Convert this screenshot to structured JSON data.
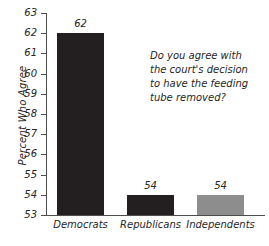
{
  "chart_data": {
    "type": "bar",
    "title": "",
    "xlabel": "",
    "ylabel": "Percent Who Agree",
    "categories": [
      "Democrats",
      "Republicans",
      "Independents"
    ],
    "values": [
      62,
      54,
      54
    ],
    "value_labels": [
      "62",
      "54",
      "54"
    ],
    "bar_colors": [
      "#231f20",
      "#231f20",
      "#8d8d8d"
    ],
    "ylim": [
      53,
      63
    ],
    "ytick_labels": [
      "63",
      "62",
      "61",
      "60",
      "59",
      "58",
      "57",
      "56",
      "55",
      "54",
      "53"
    ],
    "ytick_values": [
      63,
      62,
      61,
      60,
      59,
      58,
      57,
      56,
      55,
      54,
      53
    ],
    "grid": false,
    "legend": "none",
    "annotations": [
      {
        "name": "survey-question",
        "lines": [
          "Do you agree with",
          "the court's decision",
          "to have the feeding",
          "tube removed?"
        ]
      }
    ],
    "axis_color": "#4d4d4d",
    "background_color": "#ffffff"
  }
}
